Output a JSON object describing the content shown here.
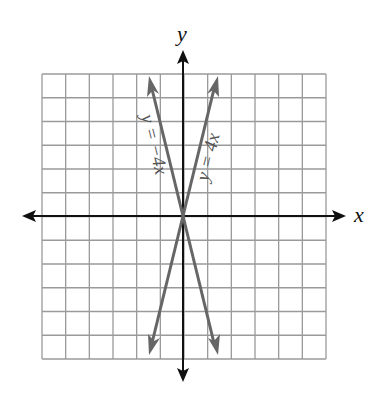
{
  "chart_data": {
    "type": "line",
    "title": "",
    "xlabel": "x",
    "ylabel": "y",
    "xlim": [
      -6,
      6
    ],
    "ylim": [
      -6,
      6
    ],
    "grid": true,
    "grid_step": 1,
    "tick_labels": false,
    "series": [
      {
        "name": "y = 4x",
        "label": "y = 4x",
        "slope": 4,
        "intercept": 0,
        "x": [
          -1.5,
          1.5
        ],
        "y": [
          -6,
          6
        ],
        "color": "#666666",
        "arrows": "both"
      },
      {
        "name": "y = -4x",
        "label": "y = −4x",
        "slope": -4,
        "intercept": 0,
        "x": [
          -1.5,
          1.5
        ],
        "y": [
          6,
          -6
        ],
        "color": "#666666",
        "arrows": "both"
      }
    ]
  },
  "labels": {
    "x_axis": "x",
    "y_axis": "y",
    "line_pos": "y = 4x",
    "line_neg": "y = −4x"
  },
  "colors": {
    "grid": "#9a9a9a",
    "axes": "#111111",
    "lines": "#666666"
  }
}
